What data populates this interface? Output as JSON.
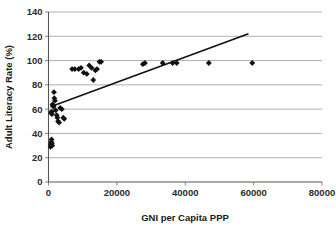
{
  "chart_data": {
    "type": "scatter",
    "title": "",
    "xlabel": "GNI per Capita PPP",
    "ylabel": "Adult Literacy Rate (%)",
    "xlim": [
      0,
      80000
    ],
    "ylim": [
      0,
      140
    ],
    "xticks": [
      0,
      20000,
      40000,
      60000,
      80000
    ],
    "yticks": [
      0,
      20,
      40,
      60,
      80,
      100,
      120,
      140
    ],
    "xtick_labels": [
      "0",
      "20000",
      "40000",
      "60000",
      "80000"
    ],
    "ytick_labels": [
      "0",
      "20",
      "40",
      "60",
      "80",
      "100",
      "120",
      "140"
    ],
    "grid": "horizontal",
    "legend": "none",
    "marker": "diamond",
    "marker_color": "#111111",
    "series": [
      {
        "name": "Countries",
        "points": [
          [
            600,
            29
          ],
          [
            700,
            31
          ],
          [
            800,
            33
          ],
          [
            900,
            35
          ],
          [
            1000,
            32
          ],
          [
            1100,
            30
          ],
          [
            700,
            57
          ],
          [
            900,
            58
          ],
          [
            1000,
            56
          ],
          [
            1200,
            64
          ],
          [
            1300,
            63
          ],
          [
            1500,
            62
          ],
          [
            1600,
            74
          ],
          [
            1700,
            69
          ],
          [
            1900,
            67
          ],
          [
            2100,
            59
          ],
          [
            2400,
            55
          ],
          [
            2600,
            53
          ],
          [
            2800,
            50
          ],
          [
            3100,
            49
          ],
          [
            3400,
            61
          ],
          [
            3900,
            60
          ],
          [
            4300,
            53
          ],
          [
            4600,
            52
          ],
          [
            6900,
            93
          ],
          [
            7700,
            93
          ],
          [
            8800,
            93
          ],
          [
            9500,
            94
          ],
          [
            10300,
            90
          ],
          [
            11200,
            89
          ],
          [
            11900,
            96
          ],
          [
            12600,
            94
          ],
          [
            13100,
            84
          ],
          [
            13700,
            92
          ],
          [
            14200,
            93
          ],
          [
            14900,
            99
          ],
          [
            15400,
            99
          ],
          [
            27600,
            97
          ],
          [
            28200,
            98
          ],
          [
            33400,
            98
          ],
          [
            36300,
            98
          ],
          [
            37500,
            98
          ],
          [
            46900,
            98
          ],
          [
            59600,
            98
          ]
        ]
      }
    ],
    "trendline": {
      "x0": 600,
      "y0": 62,
      "x1": 58500,
      "y1": 122,
      "color": "#111111"
    }
  }
}
